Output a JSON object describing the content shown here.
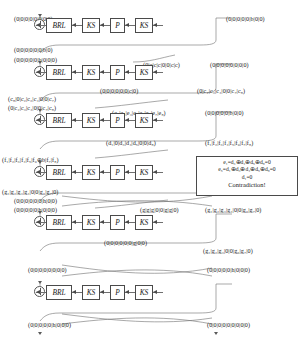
{
  "diagram": {
    "gate_labels": {
      "brl": "BRL",
      "ks": "KS",
      "p": "P"
    },
    "rounds": [
      {
        "id": "round-1",
        "top_left": "(0|0|0|0|0|0|0|0)",
        "top_right": "(0|0|0|0|0|b|0|0)",
        "bottom_left": "(0|0|0|0|0|0|b|0)",
        "bottom_mid": "",
        "bottom_right": ""
      },
      {
        "id": "round-2",
        "top_left": "(0|0|0|0|0|b|0|0|0)",
        "top_mid": "(0|c|c|c|0|0|c|c)",
        "top_right": "(0|0|0|0|0|0|0|0)",
        "bottom_left": "(c₈|0|c₂|c₃|c₄|0|0|c₇)",
        "bottom_mid": "(0|0|0|0|0|0|c|0)",
        "bottom_right": "(0|c₂|c₃|c₄|0|0|c₇|c₈)"
      },
      {
        "id": "round-3",
        "top_left": "(0|c₂|c₃|c₄|0|0|c₇|c₈)",
        "top_mid": "(e₁|e₂|e₃|e₄|e₅|e₆|e₇|e₈)",
        "top_right": "(0|0|0|0|0|b|0|0)",
        "bottom_mid": "(d₁|0|d₃|d₄|d₅|0|0|d₈)",
        "bottom_right": "(f₁|f₂|f₃|f₄|f₅|f₆|f₇|f₈)"
      },
      {
        "id": "round-4",
        "top_left": "(f₁|f₂|f₃|f₄|f₅|f₆⊕b|f₇|f₈)",
        "bottom_left": "(g₁|g₂|g₃|g₄|0|0|g₆|g₇|0)",
        "bottom_mid": "",
        "bottom_right": ""
      },
      {
        "id": "round-5",
        "top_left": "(0|0|0|0|0|0|h|0|0)",
        "top_left2": "(0|0|0|0|0|h|0|0|0)",
        "top_mid": "(g|g|g|0|0|g|g|0)",
        "top_right": "(g₁|g₂|g₃|g₄|0|0|g₆|g₇|0)",
        "bottom_mid": "(0|0|0|0|0|0|g|0|0)",
        "bottom_right": "(g₁|g₂|g₃|0|0|g₆|g₇|0)"
      },
      {
        "id": "round-6",
        "top_left": "(0|0|0|0|0|0|0|0)",
        "top_right": "(0|0|0|0|0|h|0|0|0)",
        "bottom_left": "(0|0|0|0|0|h|0|0|0)",
        "bottom_right": "(0|0|0|0|0|0|0|0|0)"
      }
    ],
    "contradiction": {
      "eq1": "e₁=d₃⊕d₄⊕d₅⊕d₈=0",
      "eq2": "e₅=d₁⊕d₃⊕d₄⊕d₅⊕d₈=0",
      "eq3": "d₁=0",
      "conclusion": "Contradiction!"
    }
  }
}
